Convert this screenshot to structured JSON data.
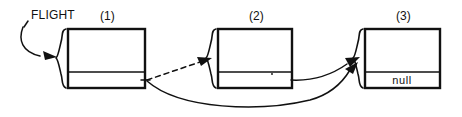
{
  "diagram": {
    "type": "linked-list",
    "background_color": "#ffffff",
    "ink_color": "#111111",
    "pointer_variable": {
      "label": "FLIGHT",
      "points_to": "node-1"
    },
    "nodes": [
      {
        "id": "node-1",
        "caption": "(1)",
        "data_value": "",
        "pointer_value": "",
        "pointer_target": "node-3",
        "x": 68,
        "y": 29,
        "width": 77,
        "height": 59,
        "divider_y": 72
      },
      {
        "id": "node-2",
        "caption": "(2)",
        "data_value": "",
        "pointer_value": "",
        "pointer_target": "node-3",
        "x": 218,
        "y": 29,
        "width": 74,
        "height": 59,
        "divider_y": 72
      },
      {
        "id": "node-3",
        "caption": "(3)",
        "data_value": "",
        "pointer_value": "null",
        "pointer_target": "",
        "x": 365,
        "y": 29,
        "width": 75,
        "height": 59,
        "divider_y": 72
      }
    ],
    "links": [
      {
        "id": "link-flight-to-node-1",
        "from": "FLIGHT",
        "to": "node-1",
        "style": "solid",
        "arrowhead": true
      },
      {
        "id": "link-node-1-to-node-2",
        "from": "node-1",
        "to": "node-2",
        "style": "dashed",
        "arrowhead": true
      },
      {
        "id": "link-node-1-to-node-3",
        "from": "node-1",
        "to": "node-3",
        "style": "solid",
        "arrowhead": true
      },
      {
        "id": "link-node-2-to-node-3",
        "from": "node-2",
        "to": "node-3",
        "style": "solid",
        "arrowhead": true
      }
    ]
  }
}
